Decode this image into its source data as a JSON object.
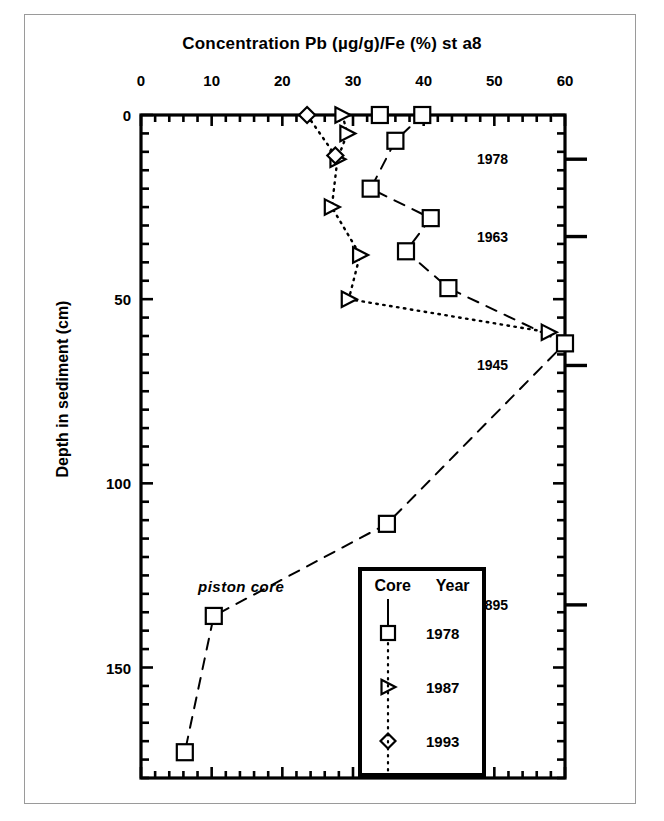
{
  "chart_data": {
    "type": "line",
    "title": "Concentration Pb (µg/g)/Fe (%)  st a8",
    "xlabel": "Concentration Pb (µg/g)/Fe (%)",
    "ylabel": "Depth in sediment (cm)",
    "xlim": [
      0,
      60
    ],
    "ylim": [
      0,
      180
    ],
    "y_inverted": true,
    "grid": false,
    "x_ticks": [
      0,
      10,
      20,
      30,
      40,
      50,
      60
    ],
    "x_tick_labels": [
      "0",
      "10",
      "20",
      "30",
      "40",
      "50",
      "60"
    ],
    "y_ticks": [
      0,
      50,
      100,
      150
    ],
    "y_tick_labels": [
      "0",
      "50",
      "100",
      "150"
    ],
    "annotations": [
      {
        "text": "piston core",
        "x_value": 9,
        "y_value": 125,
        "style": "italic"
      }
    ],
    "secondary_axis": {
      "label": "Year",
      "position": "right",
      "markers": [
        {
          "label": "1978",
          "depth": 12
        },
        {
          "label": "1963",
          "depth": 33
        },
        {
          "label": "1945",
          "depth": 68
        },
        {
          "label": "1895",
          "depth": 133
        }
      ]
    },
    "legend": {
      "position": "inside-bottom-right",
      "col_headers": [
        "Core",
        "Year"
      ],
      "entries": [
        {
          "marker": "square",
          "label": "1978"
        },
        {
          "marker": "triangle-right",
          "label": "1987"
        },
        {
          "marker": "diamond",
          "label": "1993"
        }
      ]
    },
    "series": [
      {
        "name": "1978",
        "marker": "square",
        "line_style": "dashed",
        "points": [
          {
            "x": 33.8,
            "y": 0
          },
          {
            "x": 39.8,
            "y": 0
          },
          {
            "x": 36.0,
            "y": 7
          },
          {
            "x": 32.5,
            "y": 20
          },
          {
            "x": 41.0,
            "y": 28
          },
          {
            "x": 37.5,
            "y": 37
          },
          {
            "x": 43.5,
            "y": 47
          },
          {
            "x": 60.0,
            "y": 62
          },
          {
            "x": 34.8,
            "y": 111
          },
          {
            "x": 10.3,
            "y": 136
          },
          {
            "x": 6.2,
            "y": 173
          }
        ]
      },
      {
        "name": "1987",
        "marker": "triangle-right",
        "line_style": "dotted",
        "points": [
          {
            "x": 28.5,
            "y": 0
          },
          {
            "x": 29.2,
            "y": 5
          },
          {
            "x": 27.8,
            "y": 12
          },
          {
            "x": 27.0,
            "y": 25
          },
          {
            "x": 31.0,
            "y": 38
          },
          {
            "x": 29.4,
            "y": 50
          },
          {
            "x": 57.7,
            "y": 59
          }
        ]
      },
      {
        "name": "1993",
        "marker": "diamond",
        "line_style": "dotted",
        "points": [
          {
            "x": 23.5,
            "y": 0
          },
          {
            "x": 27.5,
            "y": 11
          }
        ]
      }
    ]
  },
  "title": {
    "text": "Concentration Pb (µg/g)/Fe (%)  st a8"
  },
  "axes": {
    "y_title": "Depth in sediment (cm)"
  },
  "annotation": {
    "piston_core": "piston core"
  },
  "legend": {
    "header_core": "Core",
    "header_year": "Year",
    "row1": "1978",
    "row2": "1987",
    "row3": "1993"
  },
  "years": {
    "y1": "1978",
    "y2": "1963",
    "y3": "1945",
    "y4": "1895"
  },
  "colors": {
    "ink": "#000000",
    "frame": "#9a9a9a",
    "background": "#ffffff"
  }
}
